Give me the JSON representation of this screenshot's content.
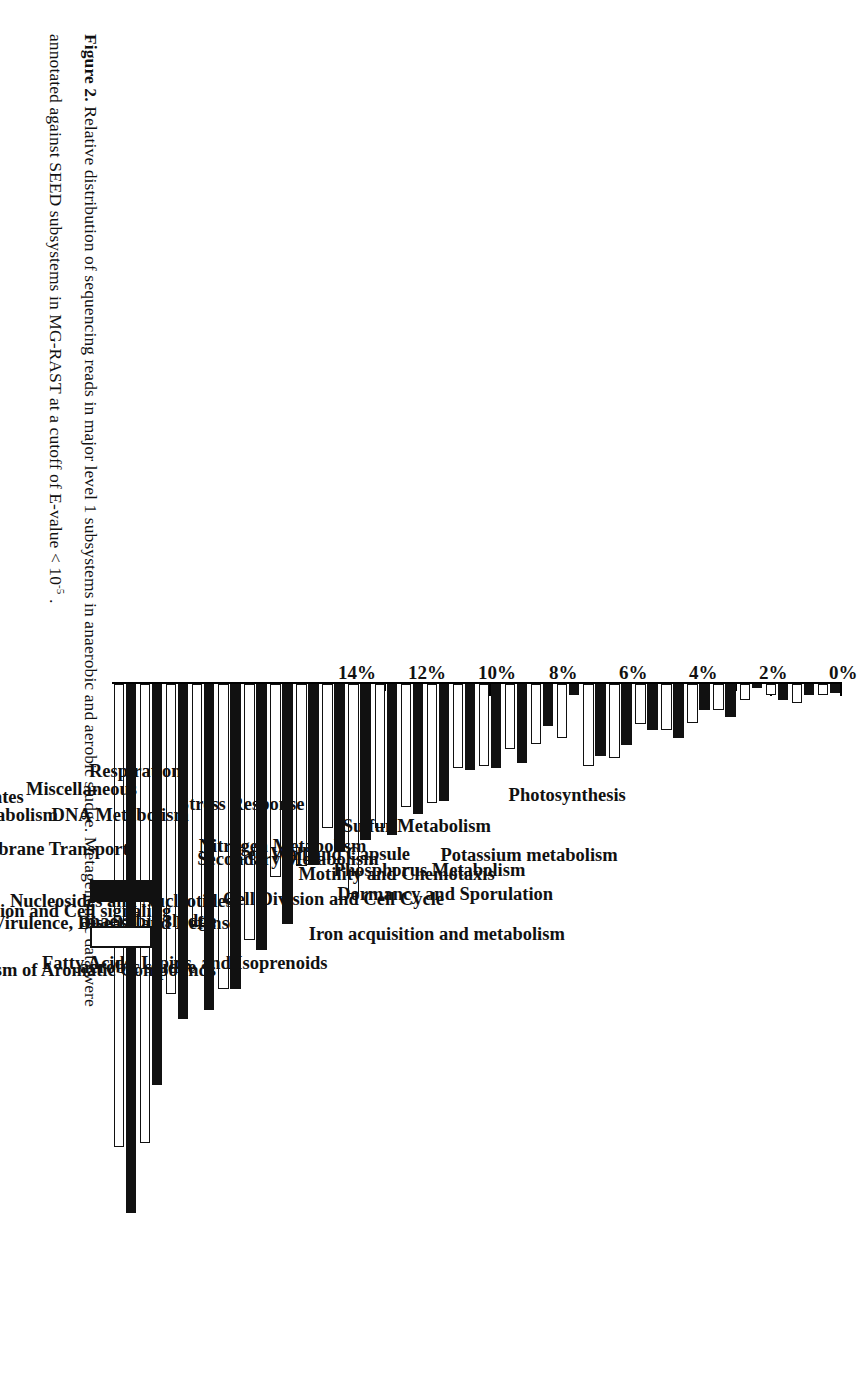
{
  "figure": {
    "label": "Figure 2.",
    "caption_line1": "Relative distribution of sequencing reads in major level 1 subsystems in anaerobic and aerobic sludge. Metagenomic data were",
    "caption_line2_a": "annotated against SEED subsystems in MG-RAST at a cutoff of E-value < 10",
    "caption_line2_sup": "-5",
    "caption_line2_b": " ."
  },
  "legend": {
    "position": "right",
    "entries": [
      {
        "label": "anaerobic sludge",
        "swatch": "filled-black-square",
        "color": "#111111"
      },
      {
        "label": "aerobic sludge",
        "swatch": "open-white-square",
        "color": "#FFFFFF"
      }
    ]
  },
  "axis": {
    "tick_labels": [
      "0%",
      "2%",
      "4%",
      "6%",
      "8%",
      "10%",
      "12%",
      "14%"
    ],
    "tick_values": [
      0,
      2,
      4,
      6,
      8,
      10,
      12,
      14
    ],
    "minor_tick_step": 1
  },
  "chart_data": {
    "type": "bar",
    "orientation": "horizontal",
    "title": "",
    "xlabel": "",
    "ylabel": "",
    "xlim": [
      0,
      14.55
    ],
    "grid": false,
    "legend_position": "right",
    "categories": [
      "Iron acquisition and metabolism",
      "Potassium metabolism",
      "Dormancy and Sporulation",
      "Photosynthesis",
      "Phosphorus Metabolism",
      "Motility and Chemotaxis",
      "Cell Division and Cell Cycle",
      "Sulfur Metabolism",
      "Fatty Acids, Lipids, and Isoprenoids",
      "Cell Wall and Capsule",
      "Secondary Metabolism",
      "Nitrogen Metabolism",
      "Metabolism of Aromatic Compounds",
      "Virulence, Disease and Defense",
      "Nucleosides and Nucleotides",
      "Stress Response",
      "Regulation and Cell signaling",
      "Phages, Prophages, Transposable elements, Plasmids",
      "Cofactors, Vitamins, Prosthetic Groups, Pigments",
      "DNA Metabolism",
      "Membrane Transport",
      "Respiration",
      "Miscellaneous",
      "Amino Acids and Derivatives",
      "RNA Metabolism",
      "Clustering-based subsystems",
      "Carbohydrates",
      "Protein Metabolism"
    ],
    "series": [
      {
        "name": "anaerobic sludge",
        "color": "#111111",
        "values": [
          0.25,
          0.3,
          0.45,
          0.12,
          0.95,
          0.75,
          1.55,
          1.3,
          1.75,
          2.05,
          0.3,
          1.2,
          2.25,
          2.4,
          2.45,
          3.35,
          3.7,
          4.3,
          4.45,
          4.8,
          5.15,
          6.85,
          7.6,
          8.7,
          9.3,
          9.55,
          11.45,
          15.1
        ]
      },
      {
        "name": "aerobic sludge",
        "color": "#FFFFFF",
        "values": [
          0.3,
          0.55,
          0.3,
          0.45,
          0.75,
          1.1,
          1.3,
          1.15,
          2.1,
          2.35,
          1.55,
          1.7,
          1.85,
          2.35,
          2.4,
          3.4,
          3.5,
          4.1,
          6.0,
          4.1,
          5.2,
          5.5,
          7.3,
          8.7,
          6.9,
          8.85,
          13.1,
          13.2
        ]
      }
    ]
  }
}
